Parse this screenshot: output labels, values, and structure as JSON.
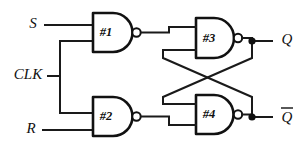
{
  "diagram": {
    "type": "logic-circuit-schematic",
    "background_color": "#ffffff",
    "line_color": "#111111",
    "width": 308,
    "height": 150,
    "inputs": [
      {
        "id": "S",
        "label": "S",
        "x": 33,
        "y": 25
      },
      {
        "id": "CLK",
        "label": "CLK",
        "x": 30,
        "y": 76
      },
      {
        "id": "R",
        "label": "R",
        "x": 31,
        "y": 130
      }
    ],
    "outputs": [
      {
        "id": "Q",
        "label": "Q",
        "overbar": false,
        "x": 287,
        "y": 41
      },
      {
        "id": "QBAR",
        "label": "Q",
        "overbar": true,
        "x": 287,
        "y": 118
      }
    ],
    "gates": [
      {
        "id": "G1",
        "label": "#1",
        "type": "NAND",
        "x": 93,
        "y": 13,
        "w": 40,
        "h": 39
      },
      {
        "id": "G2",
        "label": "#2",
        "type": "NAND",
        "x": 93,
        "y": 97,
        "w": 40,
        "h": 39
      },
      {
        "id": "G3",
        "label": "#3",
        "type": "NAND",
        "x": 196,
        "y": 18,
        "w": 38,
        "h": 40
      },
      {
        "id": "G4",
        "label": "#4",
        "type": "NAND",
        "x": 196,
        "y": 95,
        "w": 38,
        "h": 39
      }
    ],
    "junctions": [
      {
        "id": "Q-node",
        "x": 252,
        "y": 41
      },
      {
        "id": "QBAR-node",
        "x": 252,
        "y": 117
      }
    ],
    "nets": [
      {
        "id": "s-to-g1",
        "from": "S",
        "to": "#1 upper input"
      },
      {
        "id": "clk-bus",
        "from": "CLK",
        "to": "#1 lower input and #2 upper input"
      },
      {
        "id": "r-to-g2",
        "from": "R",
        "to": "#2 lower input"
      },
      {
        "id": "g1-to-g3",
        "from": "#1",
        "to": "#3 upper input"
      },
      {
        "id": "g2-to-g4",
        "from": "#2",
        "to": "#4 lower input"
      },
      {
        "id": "g3-out-to-q",
        "from": "#3",
        "to": "Q"
      },
      {
        "id": "g4-out-to-qbar",
        "from": "#4",
        "to": "Q"
      },
      {
        "id": "cross-q-to-g4",
        "from": "Q node",
        "to": "#4 upper input"
      },
      {
        "id": "cross-qbar-to-g3",
        "from": "Q-bar node",
        "to": "#3 lower input"
      }
    ]
  }
}
